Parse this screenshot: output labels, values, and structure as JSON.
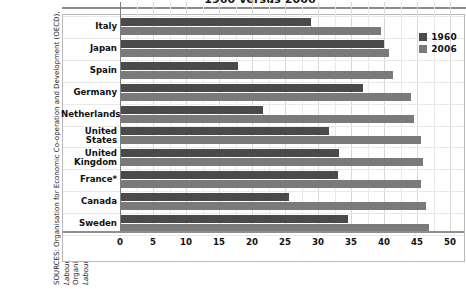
{
  "title": "1960 versus 2006",
  "source_note": {
    "prefix": "SOURCES: Organisation for Economic Co-operation and Development (OECD), ",
    "italic1": "Labour Force Statistics",
    "middle": ", 2006, 1956–1967; and International Labour Organization Bureau of Statistics, International Labour Office, ",
    "italic2": "Year Book of Labour Statistics",
    "suffix": ", Geneva, 1964."
  },
  "legend": {
    "position": "top-right",
    "items": [
      {
        "label": "1960",
        "color": "#4a4a4a"
      },
      {
        "label": "2006",
        "color": "#7a7a7a"
      }
    ]
  },
  "chart_data": {
    "type": "bar",
    "orientation": "horizontal",
    "title": "1960 versus 2006",
    "xlabel": "",
    "ylabel": "",
    "xlim": [
      0,
      52
    ],
    "xticks": [
      0,
      5,
      10,
      15,
      20,
      25,
      30,
      35,
      40,
      45,
      50
    ],
    "grid": true,
    "categories": [
      "Italy",
      "Japan",
      "Spain",
      "Germany",
      "Netherlands",
      "United States",
      "United Kingdom",
      "France*",
      "Canada",
      "Sweden"
    ],
    "series": [
      {
        "name": "1960",
        "color": "#4a4a4a",
        "values": [
          28.9,
          40.0,
          17.9,
          36.8,
          21.7,
          31.7,
          33.2,
          33.0,
          25.6,
          34.5
        ]
      },
      {
        "name": "2006",
        "color": "#7a7a7a",
        "values": [
          39.5,
          40.8,
          41.4,
          44.1,
          44.6,
          45.6,
          45.9,
          45.6,
          46.4,
          46.8
        ]
      }
    ]
  }
}
